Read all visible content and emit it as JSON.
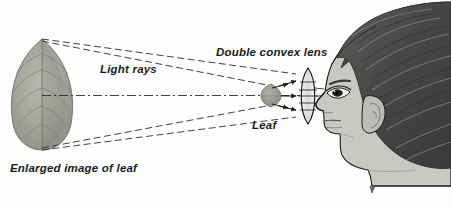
{
  "diagram": {
    "labels": {
      "light_rays": "Light rays",
      "double_convex_lens": "Double convex lens",
      "leaf": "Leaf",
      "enlarged_image": "Enlarged image of leaf"
    },
    "objects": {
      "enlarged_leaf": "enlarged-leaf-image",
      "small_leaf": "leaf-object",
      "lens": "double-convex-lens",
      "head": "human-head-profile",
      "eye": "eye",
      "ear": "ear",
      "hair": "hair"
    },
    "colors": {
      "ink": "#1a1a1a",
      "leaf_fill": "#9a9a93",
      "leaf_fill_light": "#b5b5ad",
      "skin": "#c9c9c4",
      "hair_dark": "#4b4b4b",
      "hair_mid": "#6a6a6a",
      "ray": "#333333",
      "background": "#fdfdfd"
    },
    "ray_paths": {
      "upper_pair": "from leaf apex to lens top",
      "axis": "optical axis, dash-dot, leaf center to lens center",
      "lower_pair": "from leaf base to lens bottom"
    },
    "arrow_count": 3
  }
}
